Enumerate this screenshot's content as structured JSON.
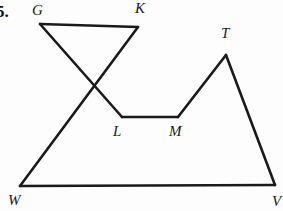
{
  "figure": {
    "problem_number": "5.",
    "stroke_color": "#1a1a1a",
    "background_color": "#fdfdfd",
    "width": 283,
    "height": 211,
    "labels": {
      "g": "G",
      "k": "K",
      "t": "T",
      "l": "L",
      "m": "M",
      "w": "W",
      "v": "V"
    },
    "points": {
      "G": [
        40,
        24
      ],
      "K": [
        138,
        27
      ],
      "T": [
        226,
        55
      ],
      "L": [
        122,
        117
      ],
      "M": [
        178,
        117
      ],
      "W": [
        20,
        186
      ],
      "V": [
        275,
        185
      ],
      "crossing": [
        93,
        85
      ]
    },
    "segments": [
      {
        "name": "segment-GK",
        "from": "G",
        "to": "K"
      },
      {
        "name": "segment-G-to-L",
        "from": "G",
        "to": "L"
      },
      {
        "name": "segment-K-to-W",
        "from": "K",
        "to": "W"
      },
      {
        "name": "segment-LM",
        "from": "L",
        "to": "M"
      },
      {
        "name": "segment-M-to-T",
        "from": "M",
        "to": "T"
      },
      {
        "name": "segment-T-to-V",
        "from": "T",
        "to": "V"
      },
      {
        "name": "segment-W-to-V",
        "from": "W",
        "to": "V"
      }
    ],
    "label_positions": {
      "g": [
        32,
        3
      ],
      "k": [
        135,
        1
      ],
      "t": [
        221,
        26
      ],
      "l": [
        113,
        124
      ],
      "m": [
        169,
        124
      ],
      "w": [
        8,
        193
      ],
      "v": [
        272,
        194
      ],
      "problem_number": [
        -4,
        3
      ]
    }
  }
}
